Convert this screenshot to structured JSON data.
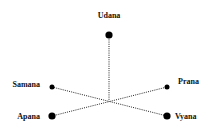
{
  "diagram": {
    "type": "radial-node-diagram",
    "center": "hub",
    "nodes": [
      {
        "id": "udana",
        "label": "Udana",
        "size": "large"
      },
      {
        "id": "samana",
        "label": "Samana",
        "size": "small"
      },
      {
        "id": "prana",
        "label": "Prana",
        "size": "small"
      },
      {
        "id": "apana",
        "label": "Apana",
        "size": "large"
      },
      {
        "id": "vyana",
        "label": "Vyana",
        "size": "large"
      }
    ],
    "edges": [
      {
        "from": "udana",
        "to": "hub",
        "style": "dotted"
      },
      {
        "from": "samana",
        "to": "vyana",
        "style": "dotted",
        "via": "hub"
      },
      {
        "from": "apana",
        "to": "prana",
        "style": "dotted",
        "via": "hub"
      }
    ],
    "colors": {
      "node": "#000000",
      "edge": "#222222",
      "text": "#111111",
      "background": "#ffffff"
    }
  }
}
